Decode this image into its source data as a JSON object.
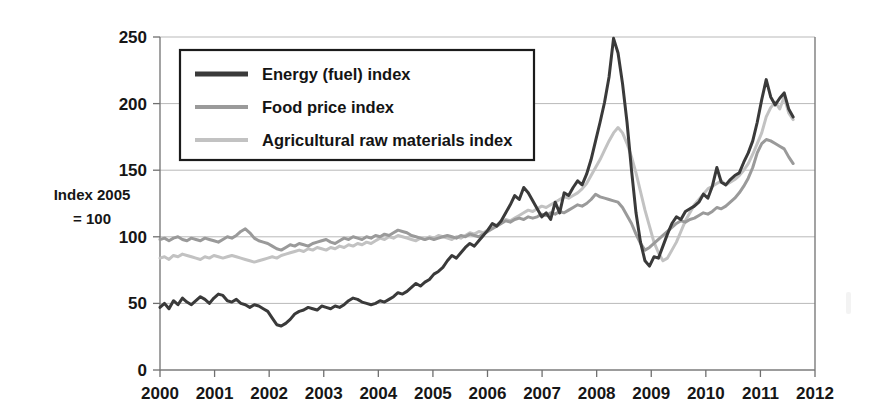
{
  "chart_data": {
    "type": "line",
    "title": "",
    "subtitle": "",
    "xlabel": "",
    "ylabel": "Index 2005 = 100",
    "ylabel_line1": "Index 2005",
    "ylabel_line2": "= 100",
    "xlim": [
      2000,
      2012
    ],
    "ylim": [
      0,
      250
    ],
    "ytick_labels": [
      "0",
      "50",
      "100",
      "150",
      "200",
      "250"
    ],
    "yticks": [
      0,
      50,
      100,
      150,
      200,
      250
    ],
    "xtick_labels": [
      "2000",
      "2001",
      "2002",
      "2003",
      "2004",
      "2005",
      "2006",
      "2007",
      "2008",
      "2009",
      "2010",
      "2011",
      "2012"
    ],
    "xticks": [
      2000,
      2001,
      2002,
      2003,
      2004,
      2005,
      2006,
      2007,
      2008,
      2009,
      2010,
      2011,
      2012
    ],
    "grid": "horizontal",
    "legend_position": "top-left-inside",
    "x_step": 0.08333,
    "x_start": 2000.0,
    "series": [
      {
        "name": "Energy (fuel) index",
        "color": "#3a3a3a",
        "width": 3.0,
        "values": [
          47,
          50,
          46,
          52,
          49,
          54,
          51,
          49,
          52,
          55,
          53,
          50,
          54,
          57,
          56,
          52,
          51,
          53,
          50,
          49,
          47,
          49,
          48,
          46,
          44,
          39,
          34,
          33,
          35,
          38,
          42,
          44,
          45,
          47,
          46,
          45,
          48,
          47,
          46,
          48,
          47,
          49,
          52,
          54,
          53,
          51,
          50,
          49,
          50,
          52,
          51,
          53,
          55,
          58,
          57,
          59,
          62,
          65,
          63,
          66,
          68,
          72,
          74,
          77,
          82,
          86,
          84,
          88,
          92,
          95,
          93,
          97,
          101,
          105,
          110,
          108,
          112,
          118,
          124,
          131,
          128,
          137,
          133,
          127,
          121,
          115,
          118,
          113,
          126,
          118,
          133,
          131,
          137,
          142,
          139,
          147,
          158,
          172,
          186,
          201,
          220,
          249,
          238,
          215,
          186,
          150,
          118,
          96,
          82,
          78,
          85,
          84,
          93,
          102,
          110,
          115,
          113,
          119,
          121,
          123,
          126,
          132,
          129,
          138,
          152,
          141,
          139,
          143,
          146,
          148,
          156,
          163,
          172,
          186,
          203,
          218,
          205,
          199,
          204,
          208,
          196,
          190
        ]
      },
      {
        "name": "Food price index",
        "color": "#9a9a9a",
        "width": 3.0,
        "values": [
          98,
          99,
          97,
          99,
          100,
          98,
          97,
          99,
          98,
          97,
          99,
          98,
          97,
          96,
          98,
          100,
          99,
          101,
          104,
          106,
          103,
          99,
          97,
          96,
          95,
          93,
          91,
          90,
          92,
          94,
          93,
          95,
          94,
          93,
          95,
          96,
          97,
          98,
          96,
          95,
          97,
          99,
          98,
          100,
          99,
          98,
          100,
          99,
          101,
          100,
          102,
          101,
          103,
          105,
          104,
          103,
          101,
          100,
          99,
          98,
          99,
          98,
          99,
          100,
          101,
          100,
          99,
          101,
          100,
          102,
          101,
          100,
          102,
          104,
          106,
          108,
          110,
          112,
          111,
          113,
          114,
          113,
          115,
          114,
          115,
          117,
          116,
          118,
          117,
          119,
          118,
          120,
          122,
          124,
          123,
          125,
          128,
          132,
          130,
          129,
          128,
          127,
          126,
          122,
          116,
          110,
          102,
          95,
          90,
          92,
          95,
          98,
          101,
          104,
          107,
          110,
          112,
          111,
          113,
          114,
          116,
          118,
          117,
          119,
          122,
          121,
          123,
          126,
          129,
          133,
          138,
          144,
          152,
          163,
          170,
          173,
          172,
          170,
          168,
          166,
          160,
          155
        ]
      },
      {
        "name": "Agricultural raw materials index",
        "color": "#c2c2c2",
        "width": 3.0,
        "values": [
          84,
          85,
          83,
          86,
          85,
          87,
          86,
          85,
          84,
          83,
          85,
          84,
          86,
          85,
          84,
          85,
          86,
          85,
          84,
          83,
          82,
          81,
          82,
          83,
          84,
          85,
          84,
          86,
          87,
          88,
          89,
          90,
          89,
          91,
          90,
          92,
          91,
          90,
          92,
          91,
          93,
          92,
          94,
          93,
          95,
          94,
          96,
          95,
          97,
          99,
          98,
          100,
          99,
          101,
          100,
          99,
          98,
          97,
          99,
          98,
          100,
          99,
          101,
          100,
          99,
          98,
          100,
          99,
          101,
          103,
          102,
          104,
          103,
          105,
          107,
          109,
          111,
          113,
          112,
          114,
          116,
          118,
          120,
          119,
          121,
          123,
          122,
          124,
          126,
          128,
          130,
          129,
          131,
          133,
          136,
          140,
          146,
          152,
          158,
          165,
          172,
          178,
          182,
          178,
          170,
          160,
          148,
          134,
          120,
          108,
          96,
          88,
          82,
          84,
          90,
          96,
          104,
          112,
          118,
          124,
          128,
          132,
          136,
          138,
          140,
          142,
          139,
          141,
          143,
          146,
          150,
          155,
          162,
          170,
          178,
          190,
          197,
          201,
          196,
          205,
          193,
          188
        ]
      }
    ]
  },
  "legend": {
    "items": [
      {
        "label": "Energy (fuel) index",
        "color": "#3a3a3a"
      },
      {
        "label": "Food price index",
        "color": "#9a9a9a"
      },
      {
        "label": "Agricultural raw materials index",
        "color": "#c2c2c2"
      }
    ]
  }
}
